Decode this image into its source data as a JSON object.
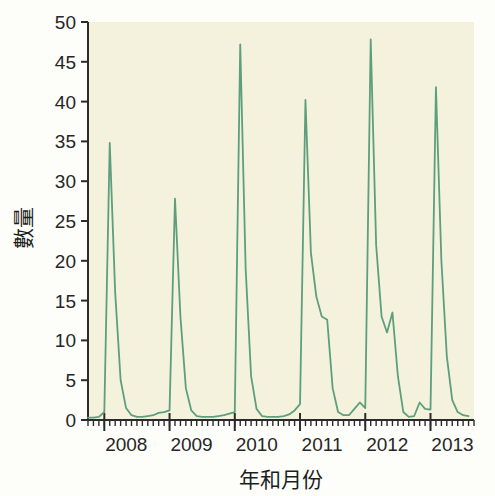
{
  "chart_data": {
    "type": "line",
    "title": "",
    "xlabel": "年和月份",
    "ylabel": "數量",
    "ylim": [
      0,
      50
    ],
    "yticks": [
      0,
      5,
      10,
      15,
      20,
      25,
      30,
      35,
      40,
      45,
      50
    ],
    "ytick_labels": [
      "0",
      "5",
      "10",
      "15",
      "20",
      "25",
      "30",
      "35",
      "40",
      "45",
      "50"
    ],
    "xlim": [
      "2007-10",
      "2013-09"
    ],
    "xtick_labels": [
      "2008",
      "2009",
      "2010",
      "2011",
      "2012",
      "2013"
    ],
    "xtick_positions": [
      "2008-01",
      "2009-01",
      "2010-01",
      "2011-01",
      "2012-01",
      "2013-01"
    ],
    "minor_ticks": "monthly",
    "grid": false,
    "legend": null,
    "line_color": "#5d9e7c",
    "line_width": 1.8,
    "plot_background": "#f4f2dd",
    "page_background": "#fdfdfa",
    "axis_color": "#2b2b2b",
    "series": [
      {
        "name": "數量",
        "x": [
          "2007-10",
          "2007-11",
          "2007-12",
          "2008-01",
          "2008-02",
          "2008-03",
          "2008-04",
          "2008-05",
          "2008-06",
          "2008-07",
          "2008-08",
          "2008-09",
          "2008-10",
          "2008-11",
          "2008-12",
          "2009-01",
          "2009-02",
          "2009-03",
          "2009-04",
          "2009-05",
          "2009-06",
          "2009-07",
          "2009-08",
          "2009-09",
          "2009-10",
          "2009-11",
          "2009-12",
          "2010-01",
          "2010-02",
          "2010-03",
          "2010-04",
          "2010-05",
          "2010-06",
          "2010-07",
          "2010-08",
          "2010-09",
          "2010-10",
          "2010-11",
          "2010-12",
          "2011-01",
          "2011-02",
          "2011-03",
          "2011-04",
          "2011-05",
          "2011-06",
          "2011-07",
          "2011-08",
          "2011-09",
          "2011-10",
          "2011-11",
          "2011-12",
          "2012-01",
          "2012-02",
          "2012-03",
          "2012-04",
          "2012-05",
          "2012-06",
          "2012-07",
          "2012-08",
          "2012-09",
          "2012-10",
          "2012-11",
          "2012-12",
          "2013-01",
          "2013-02",
          "2013-03",
          "2013-04",
          "2013-05",
          "2013-06",
          "2013-07",
          "2013-08"
        ],
        "values": [
          0.3,
          0.3,
          0.4,
          1.0,
          34.8,
          16.0,
          5.0,
          1.5,
          0.6,
          0.4,
          0.4,
          0.5,
          0.6,
          0.9,
          1.0,
          1.2,
          27.8,
          13.0,
          4.0,
          1.2,
          0.5,
          0.4,
          0.4,
          0.4,
          0.5,
          0.6,
          0.8,
          1.0,
          47.2,
          19.0,
          5.5,
          1.4,
          0.5,
          0.4,
          0.4,
          0.4,
          0.5,
          0.7,
          1.2,
          2.0,
          40.2,
          21.0,
          15.5,
          13.0,
          12.6,
          4.0,
          1.0,
          0.6,
          0.6,
          1.4,
          2.2,
          1.5,
          47.8,
          22.0,
          13.0,
          11.0,
          13.5,
          5.5,
          1.0,
          0.4,
          0.5,
          2.2,
          1.4,
          1.3,
          41.8,
          20.0,
          8.0,
          2.5,
          1.0,
          0.6,
          0.5
        ]
      }
    ]
  }
}
